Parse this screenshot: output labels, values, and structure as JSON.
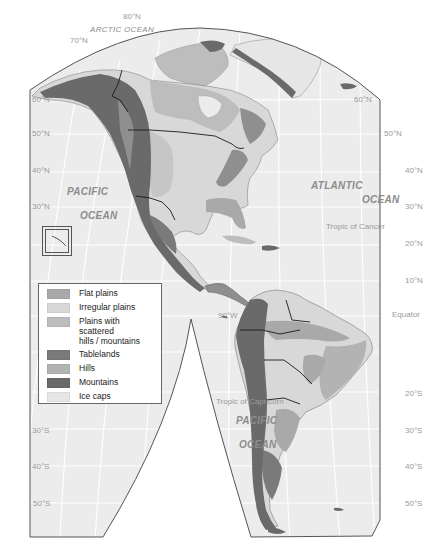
{
  "map": {
    "title": "Landforms of the Americas",
    "oceans": {
      "arctic": "ARCTIC OCEAN",
      "pacific_north_1": "PACIFIC",
      "pacific_north_2": "OCEAN",
      "atlantic_1": "ATLANTIC",
      "atlantic_2": "OCEAN",
      "pacific_south_1": "PACIFIC",
      "pacific_south_2": "OCEAN"
    },
    "reference_lines": {
      "tropic_cancer": "Tropic of Cancer",
      "equator": "Equator",
      "tropic_capricorn": "Tropic of Capricorn",
      "meridian": "90°W"
    },
    "latitudes_left": [
      "60°N",
      "50°N",
      "40°N",
      "30°N",
      "30°S",
      "40°S",
      "50°S"
    ],
    "latitudes_right": [
      "60°N",
      "50°N",
      "40°N",
      "30°N",
      "20°N",
      "10°N",
      "20°S",
      "30°S",
      "40°S",
      "50°S"
    ],
    "latitudes_top": [
      "80°N",
      "70°N"
    ]
  },
  "legend": {
    "items": [
      {
        "label": "Flat plains",
        "color": "#a9a9a9"
      },
      {
        "label": "Irregular plains",
        "color": "#d8d8d8"
      },
      {
        "label": "Plains with scattered hills / mountains",
        "label_line1": "Plains with scattered",
        "label_line2": "hills / mountains",
        "color": "#bdbdbd"
      },
      {
        "label": "Tablelands",
        "color": "#7a7a7a"
      },
      {
        "label": "Hills",
        "color": "#b3b3b3"
      },
      {
        "label": "Mountains",
        "color": "#6a6a6a"
      },
      {
        "label": "Ice caps",
        "color": "#e6e6e6"
      }
    ]
  },
  "colors": {
    "ocean": "#ececec",
    "frame": "#555555",
    "grid": "#ffffff",
    "border": "#1a1a1a"
  }
}
